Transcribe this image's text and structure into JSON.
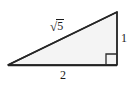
{
  "figure": {
    "kind": "right-triangle-diagram",
    "background_color": "#ffffff",
    "stroke_color": "#2b2b2b",
    "fill_color": "#f4f4f4",
    "canvas": {
      "width": 133,
      "height": 86
    },
    "vertices": {
      "left": {
        "x": 8,
        "y": 65
      },
      "bottom_right": {
        "x": 117,
        "y": 65
      },
      "top_right": {
        "x": 117,
        "y": 12
      }
    },
    "right_angle_marker": {
      "at_vertex": "bottom_right",
      "size": 11,
      "label": "right-angle"
    },
    "labels": {
      "hypotenuse": {
        "text": "√5",
        "radical_sign": "√",
        "radicand": "5"
      },
      "vertical_leg": {
        "text": "1"
      },
      "base": {
        "text": "2"
      }
    }
  }
}
